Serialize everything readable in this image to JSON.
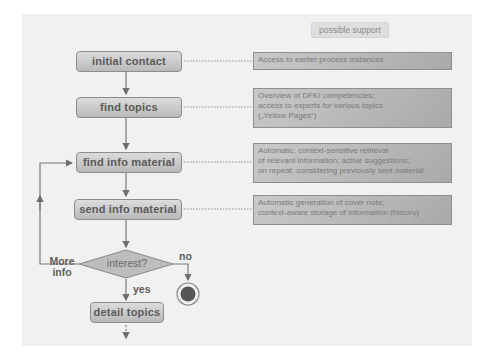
{
  "diagram": {
    "support_header": "possible support",
    "process_steps": [
      {
        "id": "initial-contact",
        "label": "initial contact"
      },
      {
        "id": "find-topics",
        "label": "find topics"
      },
      {
        "id": "find-info-material",
        "label": "find info material"
      },
      {
        "id": "send-info-material",
        "label": "send info material"
      },
      {
        "id": "detail-topics",
        "label": "detail topics"
      }
    ],
    "decision": {
      "label": "interest?",
      "branch_yes": "yes",
      "branch_no": "no",
      "branch_loop": "More info"
    },
    "support_notes": [
      {
        "for": "initial-contact",
        "lines": [
          "Access to earlier process instances"
        ]
      },
      {
        "for": "find-topics",
        "lines": [
          "Overview of DFKI competencies;",
          "access to experts for various topics",
          "(„Yellow Pages“)"
        ]
      },
      {
        "for": "find-info-material",
        "lines": [
          "Automatic, context-sensitive retrieval",
          "of relevant information; active suggestions;",
          "on repeat: considering previously sent material"
        ]
      },
      {
        "for": "send-info-material",
        "lines": [
          "Automatic generation of cover note;",
          "context-aware storage of information (history)"
        ]
      }
    ],
    "end_node": "end-state",
    "colors": {
      "box_fill_top": "#dcdcdc",
      "box_fill_bottom": "#b9b9b9",
      "box_border": "#8c8c8c",
      "line": "#7a7a7a",
      "end_fill": "#555555"
    }
  }
}
